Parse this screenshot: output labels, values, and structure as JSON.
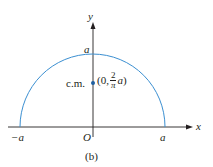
{
  "figure": {
    "caption": "(b)",
    "axes": {
      "x_label": "x",
      "y_label": "y",
      "origin_label": "O"
    },
    "ticks": {
      "neg_a": "−a",
      "pos_a": "a",
      "top_a": "a"
    },
    "point": {
      "label": "c.m.",
      "coord_open": "(0,",
      "frac_num": "2",
      "frac_den": "π",
      "coord_var": "a",
      "coord_close": ")"
    },
    "colors": {
      "curve": "#3b8fd1",
      "axis": "#231f20",
      "point": "#1f5fa0"
    }
  }
}
